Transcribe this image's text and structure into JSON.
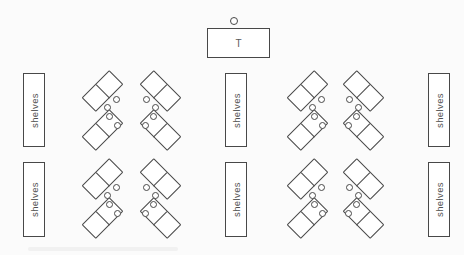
{
  "diagram": {
    "background": "#fbfbfb",
    "line_color": "#484848",
    "label_color": "#4f4f4f",
    "shelf_label": "shelves",
    "teacher": {
      "label": "T",
      "desk": {
        "x": 207,
        "y": 28,
        "w": 63,
        "h": 30
      },
      "chair": {
        "cx": 234,
        "cy": 21,
        "d": 8
      }
    },
    "shelves": [
      {
        "x": 23,
        "y": 73,
        "w": 22,
        "h": 74
      },
      {
        "x": 23,
        "y": 162,
        "w": 22,
        "h": 75
      },
      {
        "x": 225,
        "y": 73,
        "w": 22,
        "h": 74
      },
      {
        "x": 225,
        "y": 162,
        "w": 22,
        "h": 75
      },
      {
        "x": 428,
        "y": 73,
        "w": 22,
        "h": 74
      },
      {
        "x": 428,
        "y": 162,
        "w": 22,
        "h": 75
      }
    ],
    "clusters": [
      {
        "cx": 102,
        "cy": 91,
        "tilt": -45,
        "chairs": [
          [
            14,
            8
          ],
          [
            5,
            16
          ]
        ]
      },
      {
        "cx": 160,
        "cy": 91,
        "tilt": 45,
        "chairs": [
          [
            -14,
            8
          ],
          [
            -5,
            16
          ]
        ]
      },
      {
        "cx": 307,
        "cy": 91,
        "tilt": -45,
        "chairs": [
          [
            14,
            8
          ],
          [
            5,
            16
          ]
        ]
      },
      {
        "cx": 363,
        "cy": 91,
        "tilt": 45,
        "chairs": [
          [
            -14,
            8
          ],
          [
            -5,
            16
          ]
        ]
      },
      {
        "cx": 102,
        "cy": 130,
        "tilt": -45,
        "chairs": [
          [
            7,
            -14
          ],
          [
            15,
            -5
          ]
        ]
      },
      {
        "cx": 160,
        "cy": 130,
        "tilt": 45,
        "chairs": [
          [
            -7,
            -14
          ],
          [
            -15,
            -5
          ]
        ]
      },
      {
        "cx": 307,
        "cy": 130,
        "tilt": -45,
        "chairs": [
          [
            7,
            -14
          ],
          [
            15,
            -5
          ]
        ]
      },
      {
        "cx": 363,
        "cy": 130,
        "tilt": 45,
        "chairs": [
          [
            -7,
            -14
          ],
          [
            -15,
            -5
          ]
        ]
      },
      {
        "cx": 102,
        "cy": 179,
        "tilt": -45,
        "chairs": [
          [
            14,
            8
          ],
          [
            5,
            16
          ]
        ]
      },
      {
        "cx": 160,
        "cy": 179,
        "tilt": 45,
        "chairs": [
          [
            -14,
            8
          ],
          [
            -5,
            16
          ]
        ]
      },
      {
        "cx": 307,
        "cy": 179,
        "tilt": -45,
        "chairs": [
          [
            14,
            8
          ],
          [
            5,
            16
          ]
        ]
      },
      {
        "cx": 363,
        "cy": 179,
        "tilt": 45,
        "chairs": [
          [
            -14,
            8
          ],
          [
            -5,
            16
          ]
        ]
      },
      {
        "cx": 102,
        "cy": 218,
        "tilt": -45,
        "chairs": [
          [
            7,
            -14
          ],
          [
            15,
            -5
          ]
        ]
      },
      {
        "cx": 160,
        "cy": 218,
        "tilt": 45,
        "chairs": [
          [
            -7,
            -14
          ],
          [
            -15,
            -5
          ]
        ]
      },
      {
        "cx": 307,
        "cy": 218,
        "tilt": -45,
        "chairs": [
          [
            7,
            -14
          ],
          [
            15,
            -5
          ]
        ]
      },
      {
        "cx": 363,
        "cy": 218,
        "tilt": 45,
        "chairs": [
          [
            -7,
            -14
          ],
          [
            -15,
            -5
          ]
        ]
      }
    ],
    "caption_remnant": {
      "x": 28,
      "y": 247,
      "w": 150,
      "h": 4
    }
  }
}
